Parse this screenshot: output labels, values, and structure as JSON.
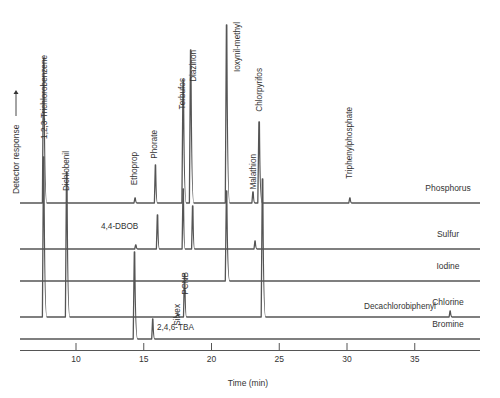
{
  "chart_data": {
    "type": "line",
    "title": "",
    "xlabel": "Time (min)",
    "ylabel": "Detector response",
    "ylabel_arrow": "→",
    "xlim": [
      5.6,
      39.5
    ],
    "x_ticks": [
      10,
      15,
      20,
      25,
      30,
      35
    ],
    "x_tick_labels": [
      "10",
      "15",
      "20",
      "25",
      "30",
      "35"
    ],
    "grid": false,
    "legend": "none (trace labels at right end of each baseline)",
    "series": [
      {
        "name": "Phosphorus",
        "baseline_y_px": 203,
        "peaks": [
          {
            "t": 7.6,
            "h": 145,
            "label": "1,2,3-Trichlorobenzene",
            "label_rotated": true
          },
          {
            "t": 9.3,
            "h": 0,
            "label": "Dichlobenil",
            "label_rotated": true
          },
          {
            "t": 14.35,
            "h": 5,
            "label": "Ethoprop",
            "label_rotated": true
          },
          {
            "t": 15.85,
            "h": 38,
            "label": "Phorate",
            "label_rotated": true
          },
          {
            "t": 17.9,
            "h": 123,
            "label": "Terbufos",
            "label_rotated": true
          },
          {
            "t": 18.45,
            "h": 153,
            "label": "Diazinon",
            "label_rotated": true
          },
          {
            "t": 21.1,
            "h": 178,
            "label": "Ioxynil-methyl",
            "label_rotated": true
          },
          {
            "t": 23.05,
            "h": 11,
            "label": "Malathion",
            "label_rotated": true
          },
          {
            "t": 23.5,
            "h": 81,
            "label": "Chlorpyrifos",
            "label_rotated": true
          },
          {
            "t": 30.2,
            "h": 5,
            "label": "Triphenylphosphate",
            "label_rotated": true
          }
        ]
      },
      {
        "name": "Sulfur",
        "baseline_y_px": 249,
        "peaks": [
          {
            "t": 14.4,
            "h": 4
          },
          {
            "t": 16.0,
            "h": 34
          },
          {
            "t": 17.9,
            "h": 60
          },
          {
            "t": 18.6,
            "h": 43
          },
          {
            "t": 23.2,
            "h": 8
          }
        ]
      },
      {
        "name": "Iodine",
        "baseline_y_px": 281,
        "peaks": [
          {
            "t": 21.1,
            "h": 90
          }
        ]
      },
      {
        "name": "Chlorine",
        "baseline_y_px": 317,
        "peaks": [
          {
            "t": 7.6,
            "h": 160
          },
          {
            "t": 9.3,
            "h": 145
          },
          {
            "t": 17.5,
            "h": 3,
            "label": "Silvex",
            "label_rotated": true
          },
          {
            "t": 18.0,
            "h": 43,
            "label": "PCNB",
            "label_rotated": true
          },
          {
            "t": 23.75,
            "h": 138
          },
          {
            "t": 37.6,
            "h": 6,
            "label": "Decachlorobiphenyl",
            "label_rotated": false
          }
        ]
      },
      {
        "name": "Bromine",
        "baseline_y_px": 339,
        "peaks": [
          {
            "t": 14.3,
            "h": 87,
            "label": "4,4-DBOB",
            "label_rotated": false
          },
          {
            "t": 15.65,
            "h": 20,
            "label": "2,4,6-TBA",
            "label_rotated": false
          }
        ]
      }
    ]
  }
}
